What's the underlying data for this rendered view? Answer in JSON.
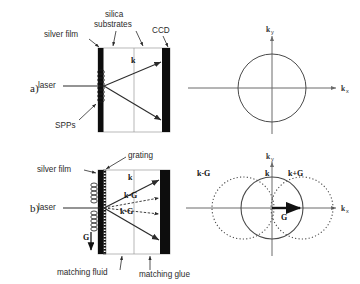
{
  "figure": {
    "panels": [
      {
        "id": "a",
        "label": "a)",
        "annotations": {
          "silver_film": "silver film",
          "silica_line1": "silica",
          "silica_line2": "substrates",
          "ccd": "CCD",
          "laser": "laser",
          "spps": "SPPs",
          "k_arrow": "k"
        },
        "kspace": {
          "axis_x": "k",
          "axis_x_sub": "x",
          "axis_y": "k",
          "axis_y_sub": "y",
          "circles": [
            {
              "name": "k",
              "label": "",
              "style": "solid",
              "cx": 0,
              "cy": 0,
              "r": 1
            }
          ]
        }
      },
      {
        "id": "b",
        "label": "b)",
        "annotations": {
          "silver_film": "silver film",
          "grating": "grating",
          "laser": "laser",
          "matching_fluid": "matching fluid",
          "matching_glue": "matching glue",
          "k_arrow": "k",
          "kminusG_upper": "k-G",
          "kminusG_lower": "k-G",
          "G_grating": "G"
        },
        "kspace": {
          "axis_x": "k",
          "axis_x_sub": "x",
          "axis_y": "k",
          "axis_y_sub": "y",
          "vector_G": "G",
          "circles": [
            {
              "name": "k-G",
              "label": "k-G",
              "style": "dotted",
              "cx": -1,
              "cy": 0,
              "r": 1
            },
            {
              "name": "k",
              "label": "k",
              "style": "solid",
              "cx": 0,
              "cy": 0,
              "r": 1
            },
            {
              "name": "k+G",
              "label": "k+G",
              "style": "dotted",
              "cx": 1,
              "cy": 0,
              "r": 1
            }
          ]
        }
      }
    ],
    "colors": {
      "ink": "#2b2b2b",
      "film": "#0d0d0d",
      "axis": "#6b6b6b",
      "circle": "#4a4a4a",
      "background": "#ffffff"
    }
  }
}
